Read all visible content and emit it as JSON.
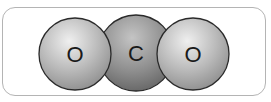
{
  "diagram": {
    "atoms": [
      {
        "id": "oxygen-left",
        "label": "O",
        "cx": 75,
        "cy": 54,
        "r": 36,
        "color_light": "#e8e8e8",
        "color_dark": "#8a8a8a"
      },
      {
        "id": "carbon",
        "label": "C",
        "cx": 136,
        "cy": 53,
        "r": 38,
        "color_light": "#bdbdbd",
        "color_dark": "#5c5c5c"
      },
      {
        "id": "oxygen-right",
        "label": "O",
        "cx": 193,
        "cy": 54,
        "r": 36,
        "color_light": "#e8e8e8",
        "color_dark": "#8a8a8a"
      }
    ],
    "frame_color": "#b4b4b4",
    "outline_color": "#2a2a2a"
  }
}
